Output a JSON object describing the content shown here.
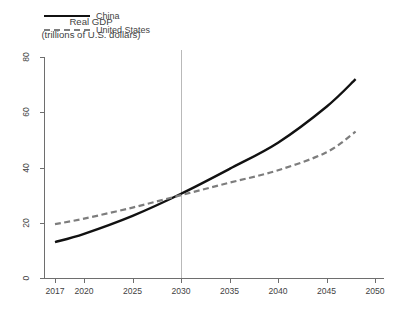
{
  "figure": {
    "title": "2017-2050",
    "y_axis_caption_line1": "Real GDP",
    "y_axis_caption_line2": "(trillions of U.S. dollars)"
  },
  "legend": {
    "position": "top-left-inside",
    "entries": [
      {
        "label": "China",
        "style": "solid",
        "color": "#111111"
      },
      {
        "label": "United States",
        "style": "dashed",
        "color": "#7d7d7d"
      }
    ]
  },
  "annotations": [
    {
      "type": "vertical-reference-line",
      "x": 2030,
      "color": "#b9b9b9"
    }
  ],
  "axis": {
    "x_tick_labels": [
      "2017",
      "2020",
      "2025",
      "2030",
      "2035",
      "2040",
      "2045",
      "2050"
    ],
    "y_tick_labels": [
      "0",
      "20",
      "40",
      "60",
      "80"
    ]
  },
  "chart_data": {
    "type": "line",
    "title": "2017-2050",
    "xlabel": "",
    "ylabel": "Real GDP (trillions of U.S. dollars)",
    "xlim": [
      2017,
      2050
    ],
    "ylim": [
      0,
      80
    ],
    "xticks": [
      2017,
      2020,
      2025,
      2030,
      2035,
      2040,
      2045,
      2050
    ],
    "yticks": [
      0,
      20,
      40,
      60,
      80
    ],
    "grid": false,
    "legend_position": "upper left",
    "annotations": [
      {
        "type": "vline",
        "x": 2030,
        "label": ""
      }
    ],
    "x": [
      2017,
      2020,
      2025,
      2030,
      2035,
      2040,
      2045,
      2048
    ],
    "series": [
      {
        "name": "China",
        "color": "#111111",
        "style": "solid",
        "values": [
          13.0,
          16.0,
          22.5,
          30.5,
          39.5,
          49.0,
          62.0,
          72.0
        ]
      },
      {
        "name": "United States",
        "color": "#7d7d7d",
        "style": "dashed",
        "values": [
          19.5,
          21.5,
          25.5,
          30.0,
          34.5,
          39.0,
          45.5,
          53.0
        ]
      }
    ]
  }
}
